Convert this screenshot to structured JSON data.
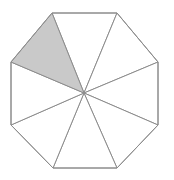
{
  "figure": {
    "shape_name": "octagon",
    "sector_count": 8,
    "shaded_sector_count": 1,
    "shaded_sector_index": 7,
    "shaded_sector_position": "upper-left",
    "fraction_shaded": "1/8",
    "background_color": "#ffffff",
    "stroke_color": "#8c8c8c",
    "stroke_width": 1,
    "unshaded_fill": "#ffffff",
    "shaded_fill": "#c9c9c9",
    "center": {
      "x": 84,
      "y": 93
    },
    "circumradius": 84,
    "vertices": [
      {
        "name": "top-left",
        "x": 52,
        "y": 13
      },
      {
        "name": "top-right",
        "x": 117,
        "y": 13
      },
      {
        "name": "right-top",
        "x": 158,
        "y": 62
      },
      {
        "name": "right-bottom",
        "x": 158,
        "y": 125
      },
      {
        "name": "bottom-right",
        "x": 117,
        "y": 168
      },
      {
        "name": "bottom-left",
        "x": 53,
        "y": 168
      },
      {
        "name": "left-bottom",
        "x": 11,
        "y": 125
      },
      {
        "name": "left-top",
        "x": 11,
        "y": 62
      }
    ],
    "sectors": [
      {
        "id": "sector-1",
        "name": "sector-top",
        "from_vertex": 0,
        "to_vertex": 1,
        "shaded": false,
        "fill": "#ffffff"
      },
      {
        "id": "sector-2",
        "name": "sector-upper-right",
        "from_vertex": 1,
        "to_vertex": 2,
        "shaded": false,
        "fill": "#ffffff"
      },
      {
        "id": "sector-3",
        "name": "sector-right",
        "from_vertex": 2,
        "to_vertex": 3,
        "shaded": false,
        "fill": "#ffffff"
      },
      {
        "id": "sector-4",
        "name": "sector-lower-right",
        "from_vertex": 3,
        "to_vertex": 4,
        "shaded": false,
        "fill": "#ffffff"
      },
      {
        "id": "sector-5",
        "name": "sector-bottom",
        "from_vertex": 4,
        "to_vertex": 5,
        "shaded": false,
        "fill": "#ffffff"
      },
      {
        "id": "sector-6",
        "name": "sector-lower-left",
        "from_vertex": 5,
        "to_vertex": 6,
        "shaded": false,
        "fill": "#ffffff"
      },
      {
        "id": "sector-7",
        "name": "sector-left",
        "from_vertex": 6,
        "to_vertex": 7,
        "shaded": false,
        "fill": "#ffffff"
      },
      {
        "id": "sector-8",
        "name": "sector-upper-left",
        "from_vertex": 7,
        "to_vertex": 0,
        "shaded": true,
        "fill": "#c9c9c9"
      }
    ]
  }
}
